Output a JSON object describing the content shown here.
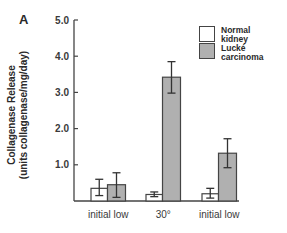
{
  "panel_label": "A",
  "chart_data": {
    "type": "bar",
    "title": "",
    "xlabel": "",
    "ylabel": "Collagenase Release (units collagenase/mg/day)",
    "ylabel_line1": "Collagenase Release",
    "ylabel_line2": "(units collagenase/mg/day)",
    "ylim": [
      0,
      5.0
    ],
    "yticks": [
      "1.0",
      "2.0",
      "3.0",
      "4.0",
      "5.0"
    ],
    "grid": false,
    "legend_position": "upper right",
    "categories": [
      "initial low",
      "30°",
      "initial low"
    ],
    "series": [
      {
        "name": "Normal kidney",
        "color": "#ffffff",
        "values": [
          0.35,
          0.18,
          0.2
        ],
        "err_low": [
          0.15,
          0.12,
          0.08
        ],
        "err_high": [
          0.6,
          0.25,
          0.35
        ]
      },
      {
        "name": "Lucké carcinoma",
        "color": "#b0b0b0",
        "values": [
          0.45,
          3.42,
          1.32
        ],
        "err_low": [
          0.1,
          2.98,
          0.92
        ],
        "err_high": [
          0.78,
          3.85,
          1.72
        ]
      }
    ]
  },
  "legend": {
    "items": [
      {
        "line1": "Normal",
        "line2": "kidney",
        "color": "#ffffff"
      },
      {
        "line1": "Lucké",
        "line2": "carcinoma",
        "color": "#b0b0b0"
      }
    ]
  }
}
